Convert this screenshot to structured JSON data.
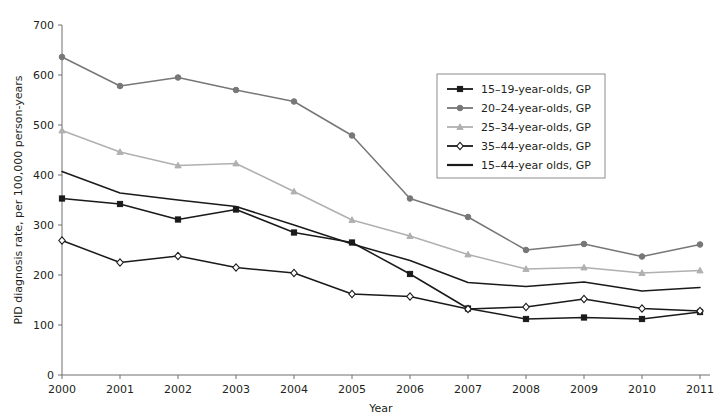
{
  "chart_data": {
    "type": "line",
    "title": "",
    "xlabel": "Year",
    "ylabel": "PID diagnosis rate, per 100,000 person-years",
    "x": [
      2000,
      2001,
      2002,
      2003,
      2004,
      2005,
      2006,
      2007,
      2008,
      2009,
      2010,
      2011
    ],
    "xtick_labels": [
      "2000",
      "2001",
      "2002",
      "2003",
      "2004",
      "2005",
      "2006",
      "2007",
      "2008",
      "2009",
      "2010",
      "2011"
    ],
    "ytick_labels": [
      "0",
      "100",
      "200",
      "300",
      "400",
      "500",
      "600",
      "700"
    ],
    "yticks": [
      0,
      100,
      200,
      300,
      400,
      500,
      600,
      700
    ],
    "ylim": [
      0,
      700
    ],
    "xlim": [
      2000,
      2011
    ],
    "grid": false,
    "legend_position": "upper-right",
    "series": [
      {
        "name": "15–19-year-olds, GP",
        "color": "#1a1a1a",
        "marker": "square",
        "values": [
          353,
          342,
          311,
          331,
          285,
          265,
          202,
          133,
          112,
          115,
          112,
          126
        ]
      },
      {
        "name": "20–24-year-olds, GP",
        "color": "#777777",
        "marker": "circle",
        "values": [
          636,
          578,
          595,
          570,
          547,
          479,
          353,
          316,
          250,
          262,
          237,
          261
        ]
      },
      {
        "name": "25–34-year-olds, GP",
        "color": "#b0b0b0",
        "marker": "triangle",
        "values": [
          489,
          446,
          419,
          423,
          367,
          310,
          278,
          241,
          212,
          215,
          204,
          209
        ]
      },
      {
        "name": "35–44-year-olds, GP",
        "color": "#1a1a1a",
        "marker": "diamond",
        "values": [
          269,
          225,
          238,
          215,
          204,
          162,
          157,
          132,
          136,
          152,
          133,
          128
        ]
      },
      {
        "name": "15–44-year olds, GP",
        "color": "#1a1a1a",
        "marker": "none",
        "values": [
          407,
          364,
          350,
          337,
          300,
          262,
          229,
          185,
          177,
          186,
          168,
          175
        ]
      }
    ]
  }
}
